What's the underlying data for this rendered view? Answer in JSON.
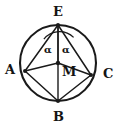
{
  "figure": {
    "type": "geometry-diagram",
    "background_color": "#ffffff",
    "stroke_color": "#1a1a1a",
    "label_color": "#141414",
    "canvas": {
      "width": 120,
      "height": 129
    }
  },
  "circle": {
    "name": "circumscribed-circle",
    "center_x": 58,
    "center_y": 63,
    "radius": 38,
    "stroke_width": 2.1
  },
  "points": {
    "E": {
      "label": "E",
      "x": 58,
      "y": 25,
      "label_x": 53,
      "label_y": 5,
      "role": "top-vertex-on-circle"
    },
    "A": {
      "label": "A",
      "x": 25,
      "y": 71,
      "label_x": 6,
      "label_y": 64,
      "role": "left-vertex-on-circle"
    },
    "C": {
      "label": "C",
      "x": 91,
      "y": 75,
      "label_x": 102,
      "label_y": 68,
      "role": "right-vertex-on-circle"
    },
    "B": {
      "label": "B",
      "x": 58,
      "y": 101,
      "label_x": 53,
      "label_y": 111,
      "role": "bottom-vertex-on-circle"
    },
    "M": {
      "label": "M",
      "x": 58,
      "y": 63,
      "label_x": 62,
      "label_y": 68,
      "role": "circle-center"
    }
  },
  "segments": [
    {
      "name": "segment-E-A",
      "from": "E",
      "to": "A"
    },
    {
      "name": "segment-E-M",
      "from": "E",
      "to": "M"
    },
    {
      "name": "segment-E-B",
      "from": "E",
      "to": "B"
    },
    {
      "name": "segment-E-C",
      "from": "E",
      "to": "C"
    },
    {
      "name": "segment-A-M",
      "from": "A",
      "to": "M"
    },
    {
      "name": "segment-M-C",
      "from": "M",
      "to": "C"
    },
    {
      "name": "segment-A-B",
      "from": "A",
      "to": "B"
    },
    {
      "name": "segment-B-C",
      "from": "B",
      "to": "C"
    }
  ],
  "angles": [
    {
      "name": "angle-alpha-left",
      "label": "α",
      "at_vertex": "E",
      "between": [
        "A",
        "M"
      ],
      "label_x": 44,
      "label_y": 46
    },
    {
      "name": "angle-alpha-right",
      "label": "α",
      "at_vertex": "E",
      "between": [
        "M",
        "C"
      ],
      "label_x": 62,
      "label_y": 46
    }
  ],
  "angle_arc": {
    "name": "angle-arc-at-E",
    "radius": 20,
    "description": "single arc spanning both alpha angles at vertex E"
  }
}
